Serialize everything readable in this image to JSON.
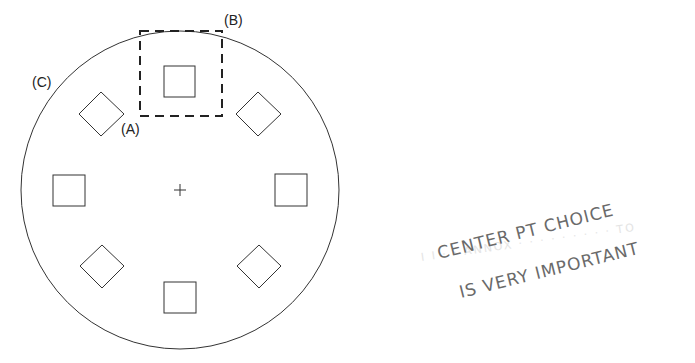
{
  "diagram": {
    "labels": {
      "a": "(A)",
      "b": "(B)",
      "c": "(C)"
    },
    "center_marker": "+",
    "circle": {
      "cx": 180,
      "cy": 190,
      "r": 159
    },
    "pads": [
      {
        "shape": "square",
        "position": "top"
      },
      {
        "shape": "diamond",
        "position": "top-right"
      },
      {
        "shape": "square",
        "position": "right"
      },
      {
        "shape": "diamond",
        "position": "bottom-right"
      },
      {
        "shape": "square",
        "position": "bottom"
      },
      {
        "shape": "diamond",
        "position": "bottom-left"
      },
      {
        "shape": "square",
        "position": "left"
      },
      {
        "shape": "diamond",
        "position": "top-left"
      }
    ]
  },
  "annotation": {
    "line1": "CENTER PT CHOICE",
    "line2": "IS VERY IMPORTANT"
  }
}
